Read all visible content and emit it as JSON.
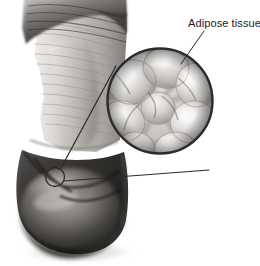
{
  "figure": {
    "kind": "anatomical-illustration",
    "background_color": "#ffffff",
    "width": 260,
    "height": 266
  },
  "labels": {
    "adipose_tissue": "Adipose tissue"
  },
  "callout": {
    "magnifier": {
      "name": "adipose-tissue-magnifier",
      "center_x": 160,
      "center_y": 101,
      "radius": 53,
      "stroke_color": "#2b2b2b",
      "stroke_width": 2.4
    },
    "source_circle": {
      "name": "adipose-tissue-source-marker",
      "center_x": 55,
      "center_y": 177,
      "radius": 9.5,
      "stroke_color": "#2b2b2b",
      "stroke_width": 1.3
    },
    "leader_line": {
      "name": "adipose-tissue-leader-line",
      "x1": 204,
      "y1": 31,
      "x2": 181,
      "y2": 64,
      "stroke_color": "#2b2b2b",
      "stroke_width": 1
    },
    "connector_upper": {
      "x1": 61,
      "y1": 168,
      "x2": 116,
      "y2": 66,
      "stroke_color": "#2b2b2b",
      "stroke_width": 1.2
    },
    "connector_lower": {
      "x1": 64,
      "y1": 181,
      "x2": 209,
      "y2": 170,
      "stroke_color": "#2b2b2b",
      "stroke_width": 1.2
    }
  },
  "palette": {
    "ink": "#2b2b2b",
    "skin_light": "#e8e6e3",
    "skin_mid": "#b9b6b2",
    "skin_dark": "#6e6b68",
    "shadow_deep": "#1c1b1a",
    "hair_dark": "#3a3937",
    "cell_light": "#f0efee",
    "cell_mid": "#c6c4c1",
    "cell_edge": "#8e8b88"
  },
  "cells": [
    {
      "name": "adipocyte-top-left",
      "cx": 132,
      "cy": 82,
      "rx": 24,
      "ry": 22,
      "rot": -18
    },
    {
      "name": "adipocyte-top-center",
      "cx": 166,
      "cy": 68,
      "rx": 23,
      "ry": 20,
      "rot": 12
    },
    {
      "name": "adipocyte-top-right",
      "cx": 196,
      "cy": 85,
      "rx": 20,
      "ry": 22,
      "rot": -8
    },
    {
      "name": "adipocyte-mid-left",
      "cx": 123,
      "cy": 121,
      "rx": 22,
      "ry": 20,
      "rot": 22
    },
    {
      "name": "adipocyte-center",
      "cx": 158,
      "cy": 108,
      "rx": 17,
      "ry": 16,
      "rot": 0
    },
    {
      "name": "adipocyte-mid-right",
      "cx": 193,
      "cy": 122,
      "rx": 23,
      "ry": 21,
      "rot": -14
    },
    {
      "name": "adipocyte-bottom-left",
      "cx": 136,
      "cy": 148,
      "rx": 19,
      "ry": 16,
      "rot": 10
    },
    {
      "name": "adipocyte-bottom-right",
      "cx": 175,
      "cy": 149,
      "rx": 21,
      "ry": 17,
      "rot": -6
    }
  ]
}
